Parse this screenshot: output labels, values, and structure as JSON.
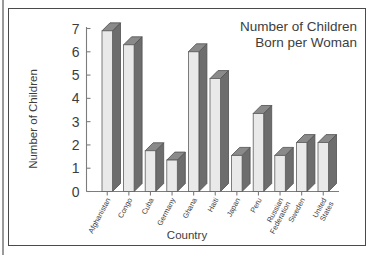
{
  "chart_data": {
    "type": "bar",
    "title": "Number of Children Born per Woman",
    "title_lines": [
      "Number of Children",
      "Born per Woman"
    ],
    "xlabel": "Country",
    "ylabel": "Number of Children",
    "ylim": [
      0,
      7
    ],
    "yticks": [
      "0",
      "1",
      "2",
      "3",
      "4",
      "5",
      "6",
      "7"
    ],
    "grid": false,
    "legend": "none",
    "style": "3d-column",
    "categories": [
      "Afghanistan",
      "Congo",
      "Cuba",
      "Germany",
      "Ghana",
      "Haiti",
      "Japan",
      "Peru",
      "Russian Federation",
      "Sweden",
      "United States"
    ],
    "category_lines": [
      [
        "Afghanistan"
      ],
      [
        "Congo"
      ],
      [
        "Cuba"
      ],
      [
        "Germany"
      ],
      [
        "Ghana"
      ],
      [
        "Haiti"
      ],
      [
        "Japan"
      ],
      [
        "Peru"
      ],
      [
        "Russian",
        "Federation"
      ],
      [
        "Sweden"
      ],
      [
        "United",
        "States"
      ]
    ],
    "values": [
      6.9,
      6.3,
      1.75,
      1.35,
      6.0,
      4.85,
      1.55,
      3.35,
      1.55,
      2.1,
      2.1
    ],
    "colors": {
      "bar_front": "#e9e9e9",
      "bar_side": "#6d6d6d",
      "bar_top": "#8a8a8a",
      "axis": "#7d7d7d",
      "text": "#3d3d3d",
      "frame": "#4a4a4a",
      "background": "#ffffff"
    }
  }
}
